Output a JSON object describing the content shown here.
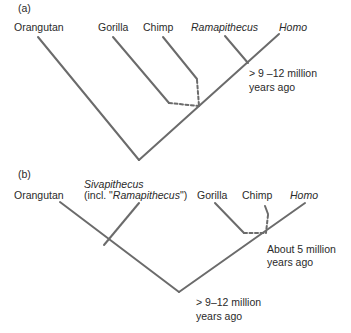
{
  "panel_a": {
    "label": "(a)",
    "taxa": {
      "orangutan": "Orangutan",
      "gorilla": "Gorilla",
      "chimp": "Chimp",
      "ramapithecus": "Ramapithecus",
      "homo": "Homo"
    },
    "annotation_line1": "> 9 –12 million",
    "annotation_line2": "years ago"
  },
  "panel_b": {
    "label": "(b)",
    "taxa": {
      "orangutan": "Orangutan",
      "sivapithecus": "Sivapithecus",
      "sivapithecus_note_prefix": "(incl. \"",
      "sivapithecus_note_italic": "Ramapithecus",
      "sivapithecus_note_suffix": "\")",
      "gorilla": "Gorilla",
      "chimp": "Chimp",
      "homo": "Homo"
    },
    "annotation_recent_line1": "About 5 million",
    "annotation_recent_line2": "years ago",
    "annotation_root_line1": "> 9–12 million",
    "annotation_root_line2": "years ago"
  },
  "colors": {
    "line": "#6b6b6b",
    "text": "#2a2a2a"
  }
}
